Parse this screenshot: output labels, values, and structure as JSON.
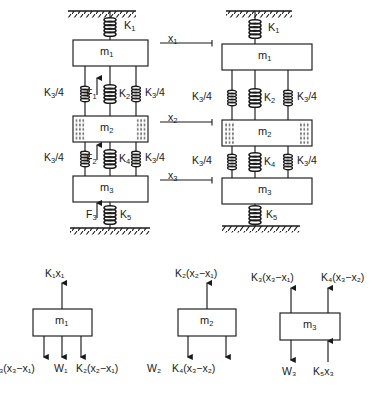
{
  "figure": {
    "kind": "mechanical-vibration-schematic",
    "panels": [
      "system-with-forces",
      "system-without-forces",
      "free-body-diagrams"
    ]
  },
  "system_left": {
    "name": "forced-system",
    "ground_top": "hatched-support",
    "ground_bottom": "hatched-support",
    "springs": [
      {
        "id": "k1",
        "label": "K",
        "sub": "1"
      },
      {
        "id": "k3a_left",
        "label": "K",
        "sub": "3",
        "suffix": "/4"
      },
      {
        "id": "k2",
        "label": "K",
        "sub": "2"
      },
      {
        "id": "k3a_right",
        "label": "K",
        "sub": "3",
        "suffix": "/4"
      },
      {
        "id": "k3b_left",
        "label": "K",
        "sub": "3",
        "suffix": "/4"
      },
      {
        "id": "k4",
        "label": "K",
        "sub": "4"
      },
      {
        "id": "k3b_right",
        "label": "K",
        "sub": "3",
        "suffix": "/4"
      },
      {
        "id": "k5",
        "label": "K",
        "sub": "5"
      }
    ],
    "masses": [
      {
        "id": "m1",
        "label": "m",
        "sub": "1"
      },
      {
        "id": "m2",
        "label": "m",
        "sub": "2"
      },
      {
        "id": "m3",
        "label": "m",
        "sub": "3"
      }
    ],
    "forces": [
      {
        "id": "f1",
        "label": "F",
        "sub": "1",
        "direction": "up"
      },
      {
        "id": "f2",
        "label": "F",
        "sub": "2",
        "direction": "up"
      },
      {
        "id": "f3",
        "label": "F",
        "sub": "3",
        "direction": "up"
      }
    ]
  },
  "displacements": [
    {
      "id": "x1",
      "label": "x",
      "sub": "1"
    },
    {
      "id": "x2",
      "label": "x",
      "sub": "2"
    },
    {
      "id": "x3",
      "label": "x",
      "sub": "3"
    }
  ],
  "mid_labels": [
    {
      "id": "k3_mid_upper",
      "label": "K",
      "sub": "3",
      "suffix": "/4"
    },
    {
      "id": "k3_mid_lower",
      "label": "K",
      "sub": "3",
      "suffix": "/4"
    }
  ],
  "system_right": {
    "name": "unforced-system",
    "ground_top": "hatched-support",
    "ground_bottom": "hatched-support",
    "springs": [
      {
        "id": "k1",
        "label": "K",
        "sub": "1"
      },
      {
        "id": "k3a_left",
        "label": "K",
        "sub": "3",
        "suffix": "/4"
      },
      {
        "id": "k2",
        "label": "K",
        "sub": "2"
      },
      {
        "id": "k3a_right",
        "label": "K",
        "sub": "3",
        "suffix": "/4"
      },
      {
        "id": "k3b_left",
        "label": "K",
        "sub": "3",
        "suffix": "/4"
      },
      {
        "id": "k4",
        "label": "K",
        "sub": "4"
      },
      {
        "id": "k3b_right",
        "label": "K",
        "sub": "3",
        "suffix": "/4"
      },
      {
        "id": "k5",
        "label": "K",
        "sub": "5"
      }
    ],
    "masses": [
      {
        "id": "m1",
        "label": "m",
        "sub": "1"
      },
      {
        "id": "m2",
        "label": "m",
        "sub": "2"
      },
      {
        "id": "m3",
        "label": "m",
        "sub": "3"
      }
    ]
  },
  "fbd": [
    {
      "id": "fbd-m1",
      "mass": "m1",
      "up_forces": [
        {
          "id": "k1x1",
          "text": "K₁x₁"
        }
      ],
      "down_forces": [
        {
          "id": "k3x3x1",
          "text": "₃(x₃−x₁)",
          "clipped": true
        },
        {
          "id": "w1",
          "text": "W₁"
        },
        {
          "id": "k2x2x1",
          "text": "K₂(x₂−x₁)"
        }
      ]
    },
    {
      "id": "fbd-m2",
      "mass": "m2",
      "up_forces": [
        {
          "id": "k2x2x1",
          "text": "K₂(x₂−x₁)"
        }
      ],
      "down_forces": [
        {
          "id": "w2",
          "text": "W₂"
        },
        {
          "id": "k4x3x2",
          "text": "K₄(x₃−x₂)"
        }
      ]
    },
    {
      "id": "fbd-m3",
      "mass": "m3",
      "up_forces": [
        {
          "id": "k3x3x1",
          "text": "K₃(x₃−x₁)"
        },
        {
          "id": "k4x3x2",
          "text": "K₄(x₃−x₂)"
        }
      ],
      "down_forces": [
        {
          "id": "w3",
          "text": "W₃"
        }
      ],
      "bottom_up_forces": [
        {
          "id": "k5x3",
          "text": "K₅x₃"
        }
      ]
    }
  ],
  "colors": {
    "line": "#1a1a1a",
    "background": "#ffffff",
    "spring_fill": "#4a4a4a"
  }
}
